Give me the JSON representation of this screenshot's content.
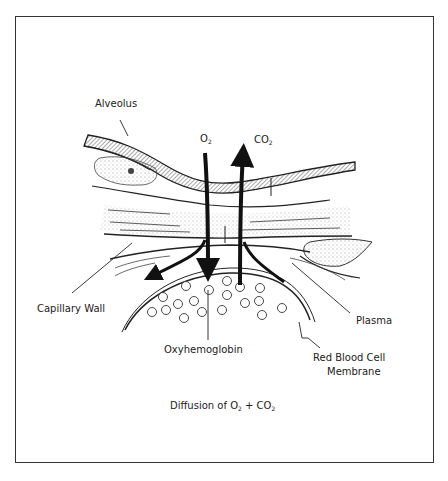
{
  "diagram": {
    "title": "Diffusion of O2 + CO2",
    "caption": {
      "prefix": "Diffusion of O",
      "sub1": "2",
      "middle": " + CO",
      "sub2": "2"
    },
    "labels": {
      "alveolus": "Alveolus",
      "o2": {
        "base": "O",
        "sub": "2"
      },
      "co2": {
        "base": "CO",
        "sub": "2"
      },
      "capillary_wall": "Capillary Wall",
      "plasma": "Plasma",
      "oxyhemoglobin": "Oxyhemoglobin",
      "rbc_membrane_line1": "Red Blood Cell",
      "rbc_membrane_line2": "Membrane"
    },
    "arrows": [
      {
        "gas": "O2",
        "direction": "down",
        "from": "alveolus",
        "to": "red blood cell"
      },
      {
        "gas": "CO2",
        "direction": "up",
        "from": "red blood cell",
        "to": "alveolus"
      }
    ],
    "colors": {
      "ink": "#222222",
      "frame": "#333333",
      "background": "#ffffff"
    }
  }
}
